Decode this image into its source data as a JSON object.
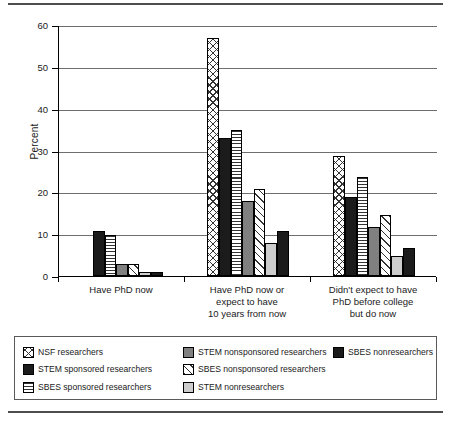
{
  "chart_data": {
    "type": "bar",
    "title": "",
    "xlabel": "",
    "ylabel": "Percent",
    "ylim": [
      0,
      60
    ],
    "yticks": [
      0,
      10,
      20,
      30,
      40,
      50,
      60
    ],
    "ytick_labels": [
      "0",
      "10",
      "20",
      "30",
      "40",
      "50",
      "60"
    ],
    "grid": true,
    "legend_position": "bottom",
    "categories": [
      "Have PhD now",
      "Have PhD now or expect to have 10 years from now",
      "Didn't expect to have PhD before college but do now"
    ],
    "category_label_lines": [
      [
        "Have PhD now"
      ],
      [
        "Have PhD now or",
        "expect to have",
        "10 years from now"
      ],
      [
        "Didn't expect to have",
        "PhD before college",
        "but do now"
      ]
    ],
    "series": [
      {
        "name": "NSF researchers",
        "pattern": "crosshatch",
        "values": [
          0,
          56.8,
          28.7
        ]
      },
      {
        "name": "STEM sponsored researchers",
        "pattern": "solid-black",
        "values": [
          10.8,
          33.0,
          18.9
        ]
      },
      {
        "name": "SBES sponsored researchers",
        "pattern": "hlines",
        "values": [
          9.9,
          34.9,
          23.6
        ]
      },
      {
        "name": "STEM nonsponsored researchers",
        "pattern": "gray",
        "values": [
          2.9,
          17.9,
          11.6
        ]
      },
      {
        "name": "SBES nonsponsored researchers",
        "pattern": "diagonal",
        "values": [
          2.9,
          20.8,
          14.6
        ]
      },
      {
        "name": "STEM nonresearchers",
        "pattern": "lightgray",
        "values": [
          0.9,
          7.9,
          4.7
        ]
      },
      {
        "name": "SBES nonresearchers",
        "pattern": "solid-black",
        "values": [
          1.0,
          10.8,
          6.7
        ]
      }
    ]
  },
  "legend": {
    "columns": [
      [
        {
          "label": "NSF researchers",
          "pattern": "crosshatch"
        },
        {
          "label": "STEM sponsored researchers",
          "pattern": "solid-black"
        },
        {
          "label": "SBES sponsored researchers",
          "pattern": "hlines"
        }
      ],
      [
        {
          "label": "STEM nonsponsored researchers",
          "pattern": "gray"
        },
        {
          "label": "SBES nonsponsored researchers",
          "pattern": "diagonal"
        },
        {
          "label": "STEM nonresearchers",
          "pattern": "lightgray"
        }
      ],
      [
        {
          "label": "SBES nonresearchers",
          "pattern": "solid-black"
        }
      ]
    ]
  },
  "colors": {
    "solid_black": "#1b1b1b",
    "gray": "#808080",
    "light_gray": "#cdcdcd",
    "gridline": "#6e6e6e",
    "axis": "#000000",
    "rule": "#4d4d4d"
  }
}
